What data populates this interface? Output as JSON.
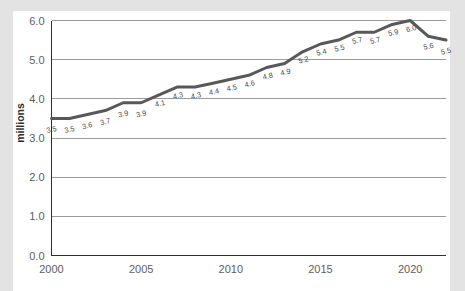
{
  "chart_data": {
    "type": "line",
    "title": "",
    "subtitle": "",
    "xlabel": "",
    "ylabel": "millions",
    "xlim": [
      2000,
      2022
    ],
    "ylim": [
      0.0,
      6.0
    ],
    "grid": true,
    "legend": "none",
    "x_tick_labels": [
      "2000",
      "2005",
      "2010",
      "2015",
      "2020"
    ],
    "x_ticks": [
      2000,
      2005,
      2010,
      2015,
      2020
    ],
    "y_tick_labels": [
      "0.0",
      "1.0",
      "2.0",
      "3.0",
      "4.0",
      "5.0",
      "6.0"
    ],
    "y_ticks": [
      0.0,
      1.0,
      2.0,
      3.0,
      4.0,
      5.0,
      6.0
    ],
    "x": [
      2000,
      2001,
      2002,
      2003,
      2004,
      2005,
      2006,
      2007,
      2008,
      2009,
      2010,
      2011,
      2012,
      2013,
      2014,
      2015,
      2016,
      2017,
      2018,
      2019,
      2020,
      2021,
      2022
    ],
    "values": [
      3.5,
      3.5,
      3.6,
      3.7,
      3.9,
      3.9,
      4.1,
      4.3,
      4.3,
      4.4,
      4.5,
      4.6,
      4.8,
      4.9,
      5.2,
      5.4,
      5.5,
      5.7,
      5.7,
      5.9,
      6.0,
      5.6,
      5.5
    ],
    "point_labels": [
      "3.5",
      "3.5",
      "3.6",
      "3.7",
      "3.9",
      "3.9",
      "4.1",
      "4.3",
      "4.3",
      "4.4",
      "4.5",
      "4.6",
      "4.8",
      "4.9",
      "5.2",
      "5.4",
      "5.5",
      "5.7",
      "5.7",
      "5.9",
      "6.0",
      "5.6",
      "5.5"
    ],
    "series": [
      {
        "name": "millions",
        "values": [
          3.5,
          3.5,
          3.6,
          3.7,
          3.9,
          3.9,
          4.1,
          4.3,
          4.3,
          4.4,
          4.5,
          4.6,
          4.8,
          4.9,
          5.2,
          5.4,
          5.5,
          5.7,
          5.7,
          5.9,
          6.0,
          5.6,
          5.5
        ],
        "color": "#585858"
      }
    ],
    "colors": {
      "line": "#585858",
      "gridline": "#9b9b9b",
      "axis": "#2f2f2f",
      "tick_text": "#5e5e5e",
      "label_text": "#4a4a4a",
      "axis_title": "#2e2e2e",
      "plot_background": "#ffffff",
      "page_background": "#e3e3e3"
    }
  }
}
